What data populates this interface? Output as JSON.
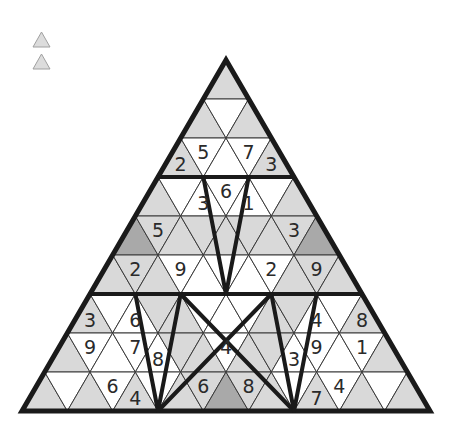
{
  "legend": {
    "items": [
      {
        "name": "legend-triangle-1",
        "color": "#dcdcdc"
      },
      {
        "name": "legend-triangle-2",
        "color": "#dcdcdc"
      }
    ]
  },
  "colors": {
    "white": "#ffffff",
    "light": "#d9d9d9",
    "dark": "#a9a9a9",
    "thin_line": "#3a3a3a",
    "thick_line": "#1a1a1a",
    "text": "#2a2a2a"
  },
  "geometry": {
    "apex_x": 226,
    "apex_y": 60,
    "base_y": 411,
    "base_left_x": 22,
    "base_right_x": 430,
    "rows": 9
  },
  "puzzle": {
    "rows": [
      {
        "shade": [
          "L"
        ],
        "digits": [
          ""
        ]
      },
      {
        "shade": [
          "L",
          "W",
          "L"
        ],
        "digits": [
          "",
          "",
          ""
        ]
      },
      {
        "shade": [
          "L",
          "W",
          "W",
          "W",
          "L"
        ],
        "digits": [
          "2",
          "5",
          "",
          "7",
          "3"
        ]
      },
      {
        "shade": [
          "L",
          "W",
          "W",
          "W",
          "W",
          "W",
          "L"
        ],
        "digits": [
          "",
          "",
          "3",
          "6",
          "1",
          "",
          ""
        ]
      },
      {
        "shade": [
          "D",
          "L",
          "L",
          "L",
          "L",
          "L",
          "L",
          "L",
          "D"
        ],
        "digits": [
          "",
          "5",
          "",
          "",
          "",
          "",
          "",
          "3",
          ""
        ]
      },
      {
        "shade": [
          "L",
          "L",
          "L",
          "W",
          "W",
          "W",
          "W",
          "W",
          "L",
          "L",
          "L"
        ],
        "digits": [
          "",
          "2",
          "",
          "9",
          "",
          "",
          "",
          "2",
          "",
          "9",
          ""
        ]
      },
      {
        "shade": [
          "L",
          "W",
          "W",
          "L",
          "L",
          "W",
          "W",
          "W",
          "L",
          "L",
          "W",
          "W",
          "L"
        ],
        "digits": [
          "3",
          "",
          "6",
          "",
          "",
          "",
          "",
          "",
          "",
          "",
          "4",
          "",
          "8"
        ]
      },
      {
        "shade": [
          "L",
          "W",
          "W",
          "W",
          "W",
          "L",
          "L",
          "W",
          "L",
          "L",
          "W",
          "W",
          "W",
          "W",
          "L"
        ],
        "digits": [
          "",
          "9",
          "",
          "7",
          "8",
          "",
          "",
          "4",
          "",
          "",
          "3",
          "9",
          "",
          "1",
          ""
        ]
      },
      {
        "shade": [
          "L",
          "W",
          "L",
          "W",
          "L",
          "W",
          "L",
          "L",
          "D",
          "L",
          "L",
          "W",
          "L",
          "W",
          "L",
          "W",
          "L"
        ],
        "digits": [
          "",
          "",
          "",
          "6",
          "4",
          "",
          "",
          "6",
          "",
          "8",
          "",
          "",
          "7",
          "4",
          "",
          "",
          ""
        ]
      }
    ]
  }
}
